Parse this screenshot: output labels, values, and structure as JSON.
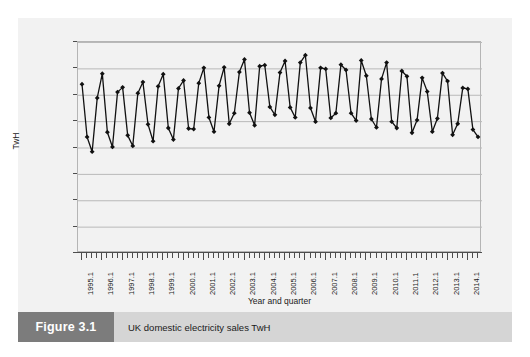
{
  "figure": {
    "number_label": "Figure 3.1",
    "caption": "UK domestic electricity sales TwH",
    "number_box_color": "#7c7c7c",
    "caption_box_color": "#d5d5d5",
    "card_background": "#f2f2f2"
  },
  "chart_data": {
    "type": "line",
    "title": "UK domestic electricity sales TwH",
    "xlabel": "Year and quarter",
    "ylabel": "TwH",
    "ylim": [
      0,
      40
    ],
    "ytick_step": 5,
    "ytick_labels": [
      "0.00",
      "5.00",
      "10.00",
      "15.00",
      "20.00",
      "25.00",
      "30.00",
      "35.00",
      "40.00"
    ],
    "ytick_values": [
      0,
      5,
      10,
      15,
      20,
      25,
      30,
      35,
      40
    ],
    "grid": "horizontal",
    "legend": "none",
    "marker": "diamond",
    "line_color": "#111111",
    "marker_color": "#111111",
    "xtick_labels": [
      "1995.1",
      "1996.1",
      "1997.1",
      "1998.1",
      "1999.1",
      "2000.1",
      "2001.1",
      "2002.1",
      "2003.1",
      "2004.1",
      "2005.1",
      "2006.1",
      "2007.1",
      "2008.1",
      "2009.1",
      "2010.1",
      "2011.1",
      "2012.1",
      "2013.1",
      "2014.1"
    ],
    "xtick_label_interval_quarters": 4,
    "x_categories": [
      "1995.1",
      "1995.2",
      "1995.3",
      "1995.4",
      "1996.1",
      "1996.2",
      "1996.3",
      "1996.4",
      "1997.1",
      "1997.2",
      "1997.3",
      "1997.4",
      "1998.1",
      "1998.2",
      "1998.3",
      "1998.4",
      "1999.1",
      "1999.2",
      "1999.3",
      "1999.4",
      "2000.1",
      "2000.2",
      "2000.3",
      "2000.4",
      "2001.1",
      "2001.2",
      "2001.3",
      "2001.4",
      "2002.1",
      "2002.2",
      "2002.3",
      "2002.4",
      "2003.1",
      "2003.2",
      "2003.3",
      "2003.4",
      "2004.1",
      "2004.2",
      "2004.3",
      "2004.4",
      "2005.1",
      "2005.2",
      "2005.3",
      "2005.4",
      "2006.1",
      "2006.2",
      "2006.3",
      "2006.4",
      "2007.1",
      "2007.2",
      "2007.3",
      "2007.4",
      "2008.1",
      "2008.2",
      "2008.3",
      "2008.4",
      "2009.1",
      "2009.2",
      "2009.3",
      "2009.4",
      "2010.1",
      "2010.2",
      "2010.3",
      "2010.4",
      "2011.1",
      "2011.2",
      "2011.3",
      "2011.4",
      "2012.1",
      "2012.2",
      "2012.3",
      "2012.4",
      "2013.1",
      "2013.2",
      "2013.3",
      "2013.4",
      "2014.1",
      "2014.2",
      "2014.3"
    ],
    "values": [
      32.0,
      22.0,
      19.2,
      29.4,
      34.0,
      22.9,
      20.1,
      30.5,
      31.4,
      22.3,
      20.3,
      30.3,
      32.4,
      24.4,
      21.2,
      31.6,
      33.9,
      23.7,
      21.5,
      31.2,
      32.7,
      23.6,
      23.5,
      32.2,
      35.1,
      25.7,
      23.0,
      31.7,
      35.2,
      24.5,
      26.5,
      34.3,
      36.7,
      26.6,
      24.2,
      35.4,
      35.6,
      27.7,
      26.2,
      34.2,
      36.4,
      27.6,
      25.7,
      36.1,
      37.5,
      27.5,
      24.9,
      35.1,
      34.9,
      25.6,
      26.5,
      35.7,
      34.7,
      26.5,
      25.1,
      36.5,
      33.6,
      25.4,
      23.8,
      33.0,
      36.1,
      24.9,
      23.7,
      34.5,
      33.5,
      22.8,
      25.2,
      33.2,
      30.6,
      23.0,
      25.5,
      34.1,
      32.6,
      22.4,
      24.5,
      31.3,
      31.1,
      23.4,
      22.0
    ]
  }
}
